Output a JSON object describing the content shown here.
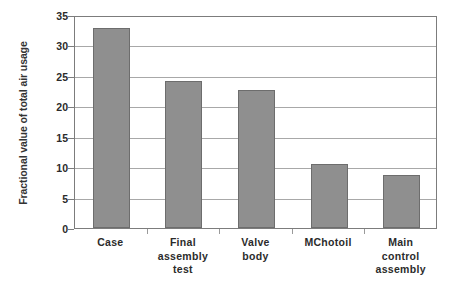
{
  "chart_data": {
    "type": "bar",
    "title": "",
    "xlabel": "",
    "ylabel": "Fractional value of total air usage",
    "categories": [
      "Case",
      "Final assembly test",
      "Valve body",
      "MChotoil",
      "Main control assembly"
    ],
    "category_lines": [
      [
        "Case"
      ],
      [
        "Final",
        "assembly",
        "test"
      ],
      [
        "Valve",
        "body"
      ],
      [
        "MChotoil"
      ],
      [
        "Main",
        "control",
        "assembly"
      ]
    ],
    "values": [
      32.9,
      24.1,
      22.7,
      10.6,
      8.7
    ],
    "ylim": [
      0,
      35
    ],
    "ytick_step": 5,
    "yticks": [
      35,
      30,
      25,
      20,
      15,
      10,
      5,
      0
    ],
    "grid": true,
    "legend": "none",
    "bar_color": "#8f8f8f",
    "bar_border_color": "#6d6d6d",
    "gridline_color": "#a8a8a8",
    "axis_color": "#7c7c7c",
    "text_color": "#2b2b2b",
    "background_color": "#ffffff"
  }
}
